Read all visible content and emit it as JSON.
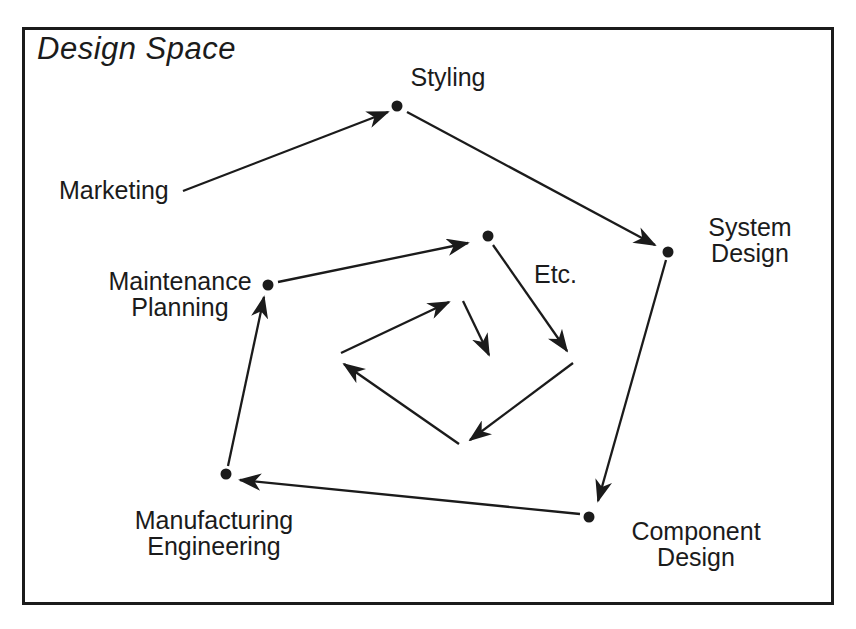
{
  "figure": {
    "title": "Design Space"
  },
  "colors": {
    "ink": "#1b1b1b",
    "background": "#ffffff"
  },
  "labels": {
    "marketing": {
      "lines": [
        "Marketing"
      ]
    },
    "styling": {
      "lines": [
        "Styling"
      ]
    },
    "system_design": {
      "lines": [
        "System",
        "Design"
      ]
    },
    "etc": {
      "lines": [
        "Etc."
      ]
    },
    "maintenance_planning": {
      "lines": [
        "Maintenance",
        "Planning"
      ]
    },
    "manufacturing_engineering": {
      "lines": [
        "Manufacturing",
        "Engineering"
      ]
    },
    "component_design": {
      "lines": [
        "Component",
        "Design"
      ]
    }
  },
  "diagram": {
    "dot_radius": 5.5,
    "stroke_width": 2.3,
    "dots": [
      {
        "name": "styling-dot",
        "x": 397,
        "y": 106
      },
      {
        "name": "system-design-dot",
        "x": 668,
        "y": 252
      },
      {
        "name": "component-design-dot",
        "x": 589,
        "y": 517
      },
      {
        "name": "manufacturing-engineering-dot",
        "x": 226,
        "y": 474
      },
      {
        "name": "maintenance-planning-dot",
        "x": 268,
        "y": 285
      },
      {
        "name": "etc-dot",
        "x": 488,
        "y": 236
      }
    ],
    "arrows": [
      {
        "name": "arrow-marketing-to-styling",
        "from": [
          183,
          191
        ],
        "to": [
          388,
          112
        ]
      },
      {
        "name": "arrow-styling-to-system-design",
        "from": [
          407,
          112
        ],
        "to": [
          655,
          245
        ]
      },
      {
        "name": "arrow-system-design-to-component-design",
        "from": [
          666,
          260
        ],
        "to": [
          598,
          501
        ]
      },
      {
        "name": "arrow-component-design-to-manufacturing-engineering",
        "from": [
          580,
          514
        ],
        "to": [
          240,
          480
        ]
      },
      {
        "name": "arrow-manufacturing-engineering-to-maintenance-planning",
        "from": [
          228,
          466
        ],
        "to": [
          264,
          297
        ]
      },
      {
        "name": "arrow-maintenance-planning-to-etc",
        "from": [
          278,
          282
        ],
        "to": [
          468,
          243
        ]
      },
      {
        "name": "arrow-etc-to-spiral-right",
        "from": [
          493,
          245
        ],
        "to": [
          567,
          351
        ]
      },
      {
        "name": "arrow-spiral-right-to-bottom",
        "from": [
          573,
          363
        ],
        "to": [
          470,
          440
        ]
      },
      {
        "name": "arrow-spiral-bottom-to-left",
        "from": [
          459,
          444
        ],
        "to": [
          344,
          364
        ]
      },
      {
        "name": "arrow-spiral-left-to-top",
        "from": [
          341,
          353
        ],
        "to": [
          449,
          302
        ]
      },
      {
        "name": "arrow-spiral-inner",
        "from": [
          463,
          301
        ],
        "to": [
          489,
          355
        ]
      }
    ]
  }
}
